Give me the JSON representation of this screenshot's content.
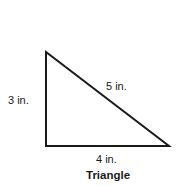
{
  "diagram": {
    "title": "Triangle",
    "shape": "right-triangle",
    "stroke_color": "#1a1a1a",
    "sides": {
      "left": "3 in.",
      "hypotenuse": "5 in.",
      "bottom": "4 in."
    }
  }
}
